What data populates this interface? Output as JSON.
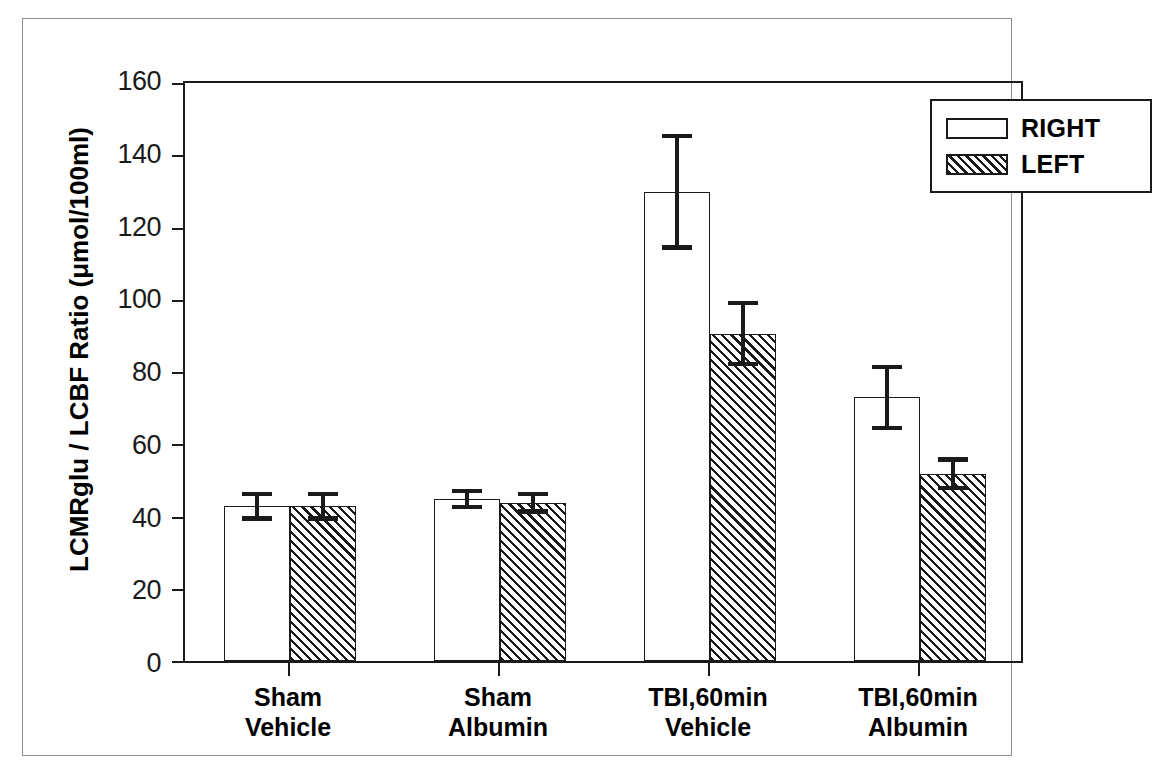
{
  "chart_data": {
    "type": "bar",
    "title": "",
    "xlabel": "",
    "ylabel": "LCMRglu / LCBF Ratio (μmol/100ml)",
    "ylim": [
      0,
      160
    ],
    "yticks": [
      0,
      20,
      40,
      60,
      80,
      100,
      120,
      140,
      160
    ],
    "ytick_labels": [
      "0",
      "20",
      "40",
      "60",
      "80",
      "100",
      "120",
      "140",
      "160"
    ],
    "grid": false,
    "legend_position": "top-right",
    "categories": [
      "Sham\nVehicle",
      "Sham\nAlbumin",
      "TBI,60min\nVehicle",
      "TBI,60min\nAlbumin"
    ],
    "category_lines": [
      [
        "Sham",
        "Vehicle"
      ],
      [
        "Sham",
        "Albumin"
      ],
      [
        "TBI,60min",
        "Vehicle"
      ],
      [
        "TBI,60min",
        "Albumin"
      ]
    ],
    "series": [
      {
        "name": "RIGHT",
        "fill": "white",
        "values": [
          42.5,
          44.5,
          129.0,
          72.5
        ],
        "errors": [
          4.0,
          2.8,
          16.0,
          9.0
        ]
      },
      {
        "name": "LEFT",
        "fill": "hatched",
        "values": [
          42.5,
          43.5,
          90.0,
          51.5
        ],
        "errors": [
          4.0,
          3.0,
          9.0,
          4.5
        ]
      }
    ]
  },
  "legend": {
    "items": [
      {
        "label": "RIGHT",
        "fill": "white"
      },
      {
        "label": "LEFT",
        "fill": "hatched"
      }
    ]
  },
  "axes": {
    "y_title": "LCMRglu / LCBF Ratio (μmol/100ml)",
    "y_labels": [
      "160",
      "140",
      "120",
      "100",
      "80",
      "60",
      "40",
      "20",
      "0"
    ]
  },
  "colors": {
    "ink": "#1a1a1a",
    "page": "#ffffff",
    "frame": "#8e8e8e"
  }
}
